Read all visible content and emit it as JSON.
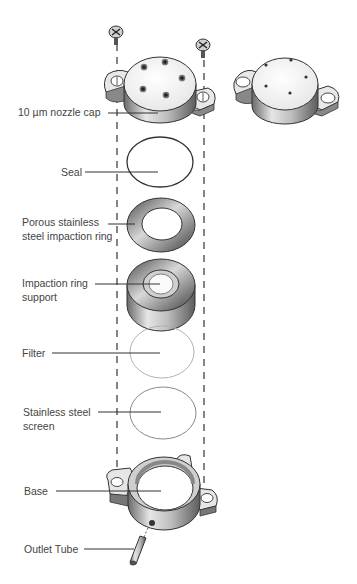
{
  "diagram": {
    "type": "exploded-assembly",
    "components": [
      {
        "id": "nozzle-cap",
        "label": "10 µm nozzle cap"
      },
      {
        "id": "seal",
        "label": "Seal"
      },
      {
        "id": "impaction-ring",
        "label_line1": "Porous stainless",
        "label_line2": "steel impaction ring"
      },
      {
        "id": "ring-support",
        "label_line1": "Impaction ring",
        "label_line2": "support"
      },
      {
        "id": "filter",
        "label": "Filter"
      },
      {
        "id": "screen",
        "label_line1": "Stainless steel",
        "label_line2": "screen"
      },
      {
        "id": "base",
        "label": "Base"
      },
      {
        "id": "outlet-tube",
        "label": "Outlet Tube"
      }
    ],
    "colors": {
      "line": "#333333",
      "metal_dark": "#5a5a5a",
      "metal_mid": "#9a9a9a",
      "metal_light": "#e8e8e8",
      "thin_outline": "#9a9a9a"
    }
  }
}
